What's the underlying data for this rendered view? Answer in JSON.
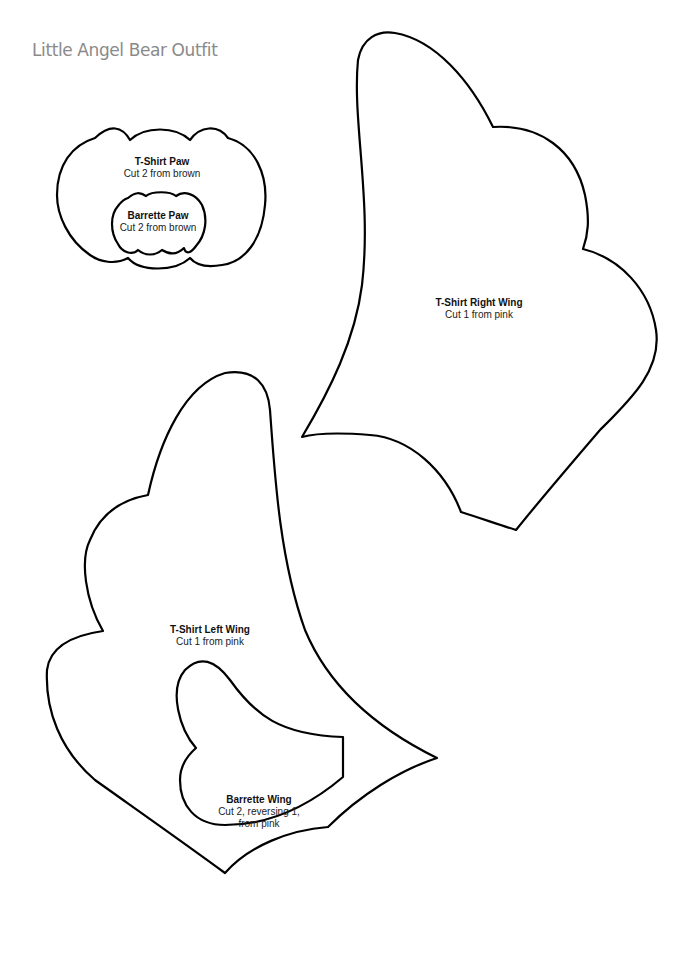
{
  "page": {
    "title": "Little Angel Bear Outfit"
  },
  "pieces": [
    {
      "name": "T-Shirt Paw",
      "lines": [
        "Cut 2 from brown"
      ],
      "x": 162,
      "y": 156
    },
    {
      "name": "Barrette Paw",
      "lines": [
        "Cut 2 from brown"
      ],
      "x": 158,
      "y": 210
    },
    {
      "name": "T-Shirt Right Wing",
      "lines": [
        "Cut 1 from pink"
      ],
      "x": 479,
      "y": 297
    },
    {
      "name": "T-Shirt Left Wing",
      "lines": [
        "Cut 1 from pink"
      ],
      "x": 210,
      "y": 624
    },
    {
      "name": "Barrette Wing",
      "lines": [
        "Cut 2, reversing 1,",
        "from pink"
      ],
      "x": 259,
      "y": 794
    }
  ],
  "colors": {
    "title": "#8a8a8a",
    "outline": "#000000",
    "background": "#ffffff"
  }
}
